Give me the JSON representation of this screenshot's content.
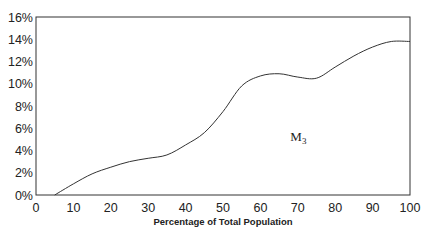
{
  "chart_data": {
    "type": "line",
    "title": "",
    "xlabel": "Percentage of Total Population",
    "ylabel": "",
    "xlim": [
      0,
      100
    ],
    "ylim": [
      0,
      16
    ],
    "x_ticks": [
      "0",
      "10",
      "20",
      "30",
      "40",
      "50",
      "60",
      "70",
      "80",
      "90",
      "100"
    ],
    "y_ticks": [
      "0%",
      "2%",
      "4%",
      "6%",
      "8%",
      "10%",
      "12%",
      "14%",
      "16%"
    ],
    "grid": false,
    "legend": null,
    "annotations": [
      {
        "text": "M",
        "subscript": "3",
        "x": 68,
        "y": 5
      }
    ],
    "series": [
      {
        "name": "M3",
        "x": [
          0,
          5,
          10,
          15,
          20,
          25,
          30,
          35,
          40,
          45,
          50,
          55,
          60,
          65,
          70,
          75,
          80,
          85,
          90,
          95,
          100
        ],
        "values": [
          0,
          0,
          1.0,
          1.9,
          2.5,
          3.0,
          3.3,
          3.6,
          4.5,
          5.6,
          7.5,
          9.8,
          10.7,
          10.9,
          10.6,
          10.5,
          11.5,
          12.5,
          13.3,
          13.8,
          13.8
        ]
      }
    ]
  }
}
